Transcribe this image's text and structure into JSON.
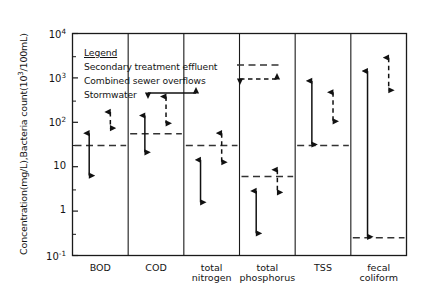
{
  "axes": {
    "ylabel": "Concentration(mg/L),Bacteria count(10",
    "ylabel_sup": "3",
    "ylabel_tail": "/100mL)",
    "yticks": [
      {
        "label": "10",
        "sup": "4",
        "value": 10000
      },
      {
        "label": "10",
        "sup": "3",
        "value": 1000
      },
      {
        "label": "10",
        "sup": "2",
        "value": 100
      },
      {
        "label": "10",
        "sup": "",
        "value": 10
      },
      {
        "label": "1",
        "sup": "",
        "value": 1
      },
      {
        "label": "10",
        "sup": "-1",
        "value": 0.1
      }
    ],
    "xticks": [
      {
        "line1": "BOD",
        "line2": ""
      },
      {
        "line1": "COD",
        "line2": ""
      },
      {
        "line1": "total",
        "line2": "nitrogen"
      },
      {
        "line1": "total",
        "line2": "phosphorus"
      },
      {
        "line1": "TSS",
        "line2": ""
      },
      {
        "line1": "fecal",
        "line2": "coliform"
      }
    ]
  },
  "legend": {
    "title": "Legend",
    "entries": [
      {
        "label": "Secondary treatment effluent",
        "symbol": "dashed-line"
      },
      {
        "label": "Combined sewer overflows",
        "symbol": "dashed-double-arrow"
      },
      {
        "label": "Stormwater",
        "symbol": "solid-double-arrow"
      }
    ]
  },
  "colors": {
    "axis": "#1a1a1a",
    "stormwater": "#111111",
    "cso": "#111111",
    "effluent": "#333333",
    "background": "#ffffff"
  },
  "chart_data": {
    "type": "bar",
    "title": "",
    "xlabel": "",
    "ylabel": "Concentration(mg/L),Bacteria count(10^3/100mL)",
    "yscale": "log",
    "ylim": [
      0.1,
      10000
    ],
    "grid": false,
    "legend_position": "inside-top-left",
    "categories": [
      "BOD",
      "COD",
      "total nitrogen",
      "total phosphorus",
      "TSS",
      "fecal coliform"
    ],
    "series": [
      {
        "name": "Stormwater",
        "style": "solid-double-arrow",
        "ranges": [
          {
            "category": "BOD",
            "low": 6,
            "high": 60
          },
          {
            "category": "COD",
            "low": 20,
            "high": 150
          },
          {
            "category": "total nitrogen",
            "low": 1.5,
            "high": 15
          },
          {
            "category": "total phosphorus",
            "low": 0.3,
            "high": 3
          },
          {
            "category": "TSS",
            "low": 30,
            "high": 900
          },
          {
            "category": "fecal coliform",
            "low": 0.25,
            "high": 1500
          }
        ]
      },
      {
        "name": "Combined sewer overflows",
        "style": "dashed-double-arrow",
        "ranges": [
          {
            "category": "BOD",
            "low": 70,
            "high": 180
          },
          {
            "category": "COD",
            "low": 90,
            "high": 400
          },
          {
            "category": "total nitrogen",
            "low": 12,
            "high": 60
          },
          {
            "category": "total phosphorus",
            "low": 2.5,
            "high": 9
          },
          {
            "category": "TSS",
            "low": 100,
            "high": 500
          },
          {
            "category": "fecal coliform",
            "low": 500,
            "high": 3000
          }
        ]
      },
      {
        "name": "Secondary treatment effluent",
        "style": "dashed-line",
        "values": [
          {
            "category": "BOD",
            "value": 30
          },
          {
            "category": "COD",
            "value": 55
          },
          {
            "category": "total nitrogen",
            "value": 30
          },
          {
            "category": "total phosphorus",
            "value": 6
          },
          {
            "category": "TSS",
            "value": 30
          },
          {
            "category": "fecal coliform",
            "value": 0.25
          }
        ]
      }
    ]
  }
}
